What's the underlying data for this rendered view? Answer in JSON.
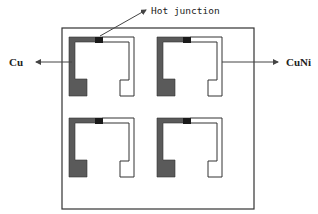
{
  "diagram": {
    "labels": {
      "hot_junction": "Hot junction",
      "left_material": "Cu",
      "right_material": "CuNi"
    },
    "colors": {
      "cu_trace": "#5a5a5a",
      "junction": "#1a1a1a",
      "outline": "#333333",
      "cuni_fill": "#ffffff"
    },
    "sensors": [
      {
        "id": "top-left",
        "x": 69,
        "y": 37
      },
      {
        "id": "top-right",
        "x": 157,
        "y": 37
      },
      {
        "id": "bottom-left",
        "x": 69,
        "y": 118
      },
      {
        "id": "bottom-right",
        "x": 157,
        "y": 118
      }
    ]
  }
}
